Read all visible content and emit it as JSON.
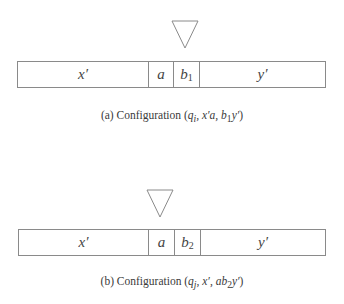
{
  "figure": {
    "panels": [
      {
        "id": "a",
        "head_position_cell": 2,
        "cells": [
          {
            "label": "x′",
            "sub": ""
          },
          {
            "label": "a",
            "sub": ""
          },
          {
            "label": "b",
            "sub": "1"
          },
          {
            "label": "y′",
            "sub": ""
          }
        ],
        "caption": {
          "prefix": "(a) Configuration (",
          "state": "q",
          "state_sub": "i",
          "left": ", x′a, ",
          "right_b": "b",
          "right_b_sub": "1",
          "right_rest": "y′",
          "suffix": ")"
        }
      },
      {
        "id": "b",
        "head_position_cell": 1,
        "cells": [
          {
            "label": "x′",
            "sub": ""
          },
          {
            "label": "a",
            "sub": ""
          },
          {
            "label": "b",
            "sub": "2"
          },
          {
            "label": "y′",
            "sub": ""
          }
        ],
        "caption": {
          "prefix": "(b) Configuration (",
          "state": "q",
          "state_sub": "j",
          "left": ", x′, ",
          "right_b": "ab",
          "right_b_sub": "2",
          "right_rest": "y′",
          "suffix": ")"
        }
      }
    ],
    "colors": {
      "line": "#8a8a8a",
      "text": "#3a3a3a"
    }
  }
}
